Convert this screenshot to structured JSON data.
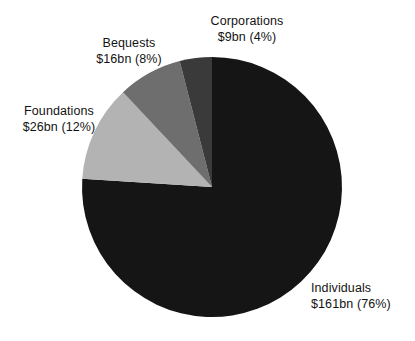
{
  "chart_data": {
    "type": "pie",
    "title": "",
    "subtitle": "",
    "xlabel": "",
    "ylabel": "",
    "legend_position": "callout-labels",
    "grid": false,
    "units": "US$ billions",
    "total_value": 212,
    "start_angle_deg": 0,
    "direction": "clockwise",
    "categories": [
      "Individuals",
      "Foundations",
      "Bequests",
      "Corporations"
    ],
    "values": [
      161,
      26,
      16,
      9
    ],
    "percents": [
      76,
      12,
      8,
      4
    ],
    "slices": [
      {
        "name": "Individuals",
        "value": 161,
        "percent": 76,
        "color": "#151515",
        "label_name": "Individuals",
        "label_value": "$161bn (76%)",
        "start_deg": 0,
        "end_deg": 273.6
      },
      {
        "name": "Foundations",
        "value": 26,
        "percent": 12,
        "color": "#b3b3b3",
        "label_name": "Foundations",
        "label_value": "$26bn (12%)",
        "start_deg": 273.6,
        "end_deg": 316.8
      },
      {
        "name": "Bequests",
        "value": 16,
        "percent": 8,
        "color": "#6e6e6e",
        "label_name": "Bequests",
        "label_value": "$16bn (8%)",
        "start_deg": 316.8,
        "end_deg": 345.6
      },
      {
        "name": "Corporations",
        "value": 9,
        "percent": 4,
        "color": "#3a3a3a",
        "label_name": "Corporations",
        "label_value": "$9bn (4%)",
        "start_deg": 345.6,
        "end_deg": 360
      }
    ],
    "geometry": {
      "center_x": 212,
      "center_y": 187,
      "radius": 130
    },
    "colors": {
      "background": "#ffffff",
      "text": "#131313",
      "individuals": "#151515",
      "foundations": "#b3b3b3",
      "bequests": "#6e6e6e",
      "corporations": "#3a3a3a"
    }
  }
}
